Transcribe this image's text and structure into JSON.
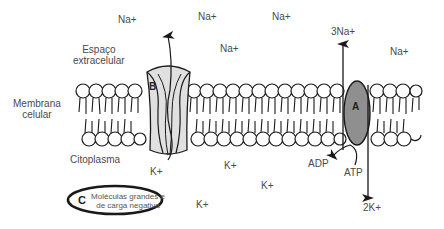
{
  "diagram": {
    "regions": {
      "extracellular": "Espaço\nextracelular",
      "extracellular_line1": "Espaço",
      "extracellular_line2": "extracelular",
      "membrane_line1": "Membrana",
      "membrane_line2": "celular",
      "cytoplasm": "Citoplasma"
    },
    "ions_outside": [
      {
        "label": "Na+",
        "x": 103,
        "y": 16
      },
      {
        "label": "Na+",
        "x": 198,
        "y": 12
      },
      {
        "label": "Na+",
        "x": 272,
        "y": 12
      },
      {
        "label": "Na+",
        "x": 220,
        "y": 44
      },
      {
        "label": "Na+",
        "x": 390,
        "y": 47
      }
    ],
    "ions_inside": [
      {
        "label": "K+",
        "x": 150,
        "y": 166
      },
      {
        "label": "K+",
        "x": 224,
        "y": 160
      },
      {
        "label": "K+",
        "x": 261,
        "y": 180
      },
      {
        "label": "K+",
        "x": 197,
        "y": 199
      }
    ],
    "channel_b": {
      "letter": "B",
      "ion_in": "K+",
      "color": "#e0e0e0"
    },
    "pump_a": {
      "letter": "A",
      "ion_out": "3Na+",
      "ion_in": "2K+",
      "atp": "ATP",
      "adp": "ADP",
      "color": "#8f8f8f"
    },
    "molecule_c": {
      "letter": "C",
      "line1": "Moléculas grandes e",
      "line2": "de carga negativa"
    }
  }
}
